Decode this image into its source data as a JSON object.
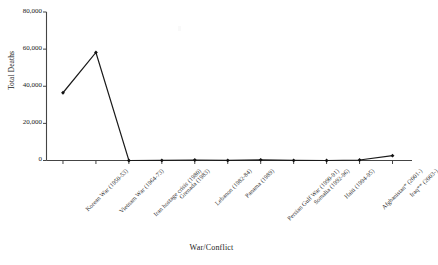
{
  "chart_data": {
    "type": "line",
    "title": "",
    "xlabel": "War/Conflict",
    "ylabel": "Total Deaths",
    "categories": [
      "Korean War (1950-53)",
      "Vietnam War (1964-73)",
      "Iran hostage crisis (1980)",
      "Grenada (1983)",
      "Lebanon (1982-84)",
      "Panama (1989)",
      "Persian Gulf War (1990-91)",
      "Somalia (1992-96)",
      "Haiti (1994-95)",
      "Afghanistan* (2001-)",
      "Iraq** (2003-)"
    ],
    "values": [
      36500,
      58200,
      8,
      19,
      265,
      23,
      383,
      43,
      4,
      280,
      2600
    ],
    "ylim": [
      0,
      80000
    ],
    "yticks": [
      0,
      20000,
      40000,
      60000,
      80000
    ],
    "ytick_labels": [
      "0",
      "20,000",
      "40,000",
      "60,000",
      "80,000"
    ],
    "grid": false,
    "legend": false,
    "marker": "filled-diamond",
    "line_color": "#1a1a1a",
    "marker_color": "#111111",
    "axis_color": "#444444",
    "background": "#ffffff"
  },
  "axes": {
    "y_title": "Total Deaths",
    "x_title": "War/Conflict"
  }
}
